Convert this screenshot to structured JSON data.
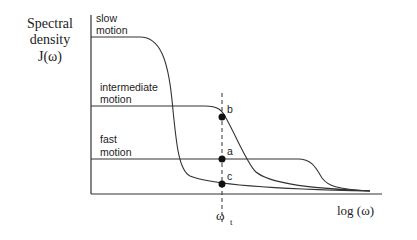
{
  "diagram": {
    "y_axis_label": [
      "Spectral",
      "density",
      "J(ω)"
    ],
    "x_axis_label": "log (ω)",
    "marker_label": "ω",
    "marker_subscript": "t",
    "curves": [
      {
        "id": "slow",
        "label_lines": [
          "slow",
          "motion"
        ]
      },
      {
        "id": "intermediate",
        "label_lines": [
          "intermediate",
          "motion"
        ]
      },
      {
        "id": "fast",
        "label_lines": [
          "fast",
          "motion"
        ]
      }
    ],
    "points": [
      {
        "label": "b",
        "curve": "intermediate"
      },
      {
        "label": "a",
        "curve": "fast"
      },
      {
        "label": "c",
        "curve": "slow"
      }
    ]
  }
}
